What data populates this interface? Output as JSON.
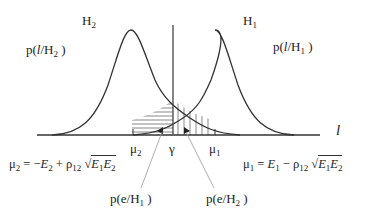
{
  "diagram": {
    "hypotheses": [
      {
        "id": "H2",
        "label": "H",
        "sub": "2",
        "pdf_label_pre": "p(",
        "pdf_var": "l",
        "pdf_label_mid": "/H",
        "pdf_sub": "2",
        "pdf_label_post": " )",
        "mean_label": "μ",
        "mean_sub": "2"
      },
      {
        "id": "H1",
        "label": "H",
        "sub": "1",
        "pdf_label_pre": "p(",
        "pdf_var": "l",
        "pdf_label_mid": "/H",
        "pdf_sub": "1",
        "pdf_label_post": " )",
        "mean_label": "μ",
        "mean_sub": "1"
      }
    ],
    "axis_label": "l",
    "threshold_label": "γ",
    "equations": {
      "mu2": {
        "lhs": "μ",
        "lhs_sub": "2",
        "rhs_1": " = −",
        "E": "E",
        "E_sub": "2",
        "plus": " + ρ",
        "rho_sub": "12",
        "sqrt_E1": "E",
        "sqrt_E1_sub": "1",
        "sqrt_E2": "E",
        "sqrt_E2_sub": "2"
      },
      "mu1": {
        "lhs": "μ",
        "lhs_sub": "1",
        "rhs_1": " = ",
        "E": "E",
        "E_sub": "1",
        "minus": " − ρ",
        "rho_sub": "12",
        "sqrt_E1": "E",
        "sqrt_E1_sub": "1",
        "sqrt_E2": "E",
        "sqrt_E2_sub": "2"
      }
    },
    "error_labels": [
      {
        "pre": "p(e/H",
        "sub": "1",
        "post": " )"
      },
      {
        "pre": "p(e/H",
        "sub": "2",
        "post": " )"
      }
    ],
    "colors": {
      "stroke": "#333333",
      "leader": "#999999"
    }
  }
}
